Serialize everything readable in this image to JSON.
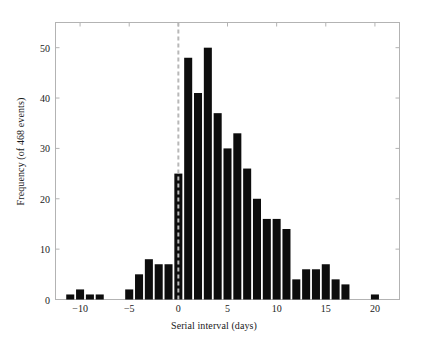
{
  "chart_data": {
    "type": "bar",
    "title": "",
    "subtitle": "",
    "xlabel": "Serial interval (days)",
    "ylabel": "Frequency (of 468 events)",
    "xlim": [
      -12.5,
      22.5
    ],
    "ylim": [
      0,
      55
    ],
    "xticks": [
      -10,
      -5,
      0,
      5,
      10,
      15,
      20
    ],
    "xtick_labels": [
      "−10",
      "−5",
      "0",
      "5",
      "10",
      "15",
      "20"
    ],
    "yticks": [
      0,
      10,
      20,
      30,
      40,
      50
    ],
    "ytick_labels": [
      "0",
      "10",
      "20",
      "30",
      "40",
      "50"
    ],
    "grid": false,
    "legend": null,
    "bar_color": "#0d0d0d",
    "axis_color": "#b3b3b3",
    "bin_width": 1,
    "annotations": [
      {
        "type": "vline",
        "x": 0,
        "style": "dashed",
        "color": "#b8b8b8",
        "label": ""
      }
    ],
    "categories": [
      -11,
      -10,
      -9,
      -8,
      -5,
      -4,
      -3,
      -2,
      -1,
      0,
      1,
      2,
      3,
      4,
      5,
      6,
      7,
      8,
      9,
      10,
      11,
      12,
      13,
      14,
      15,
      16,
      17,
      20
    ],
    "values": [
      1,
      2,
      1,
      1,
      2,
      5,
      8,
      7,
      7,
      25,
      48,
      41,
      50,
      37,
      30,
      33,
      26,
      20,
      16,
      16,
      14,
      4,
      6,
      6,
      7,
      4,
      3,
      1
    ]
  },
  "figure": {
    "caption": ""
  }
}
